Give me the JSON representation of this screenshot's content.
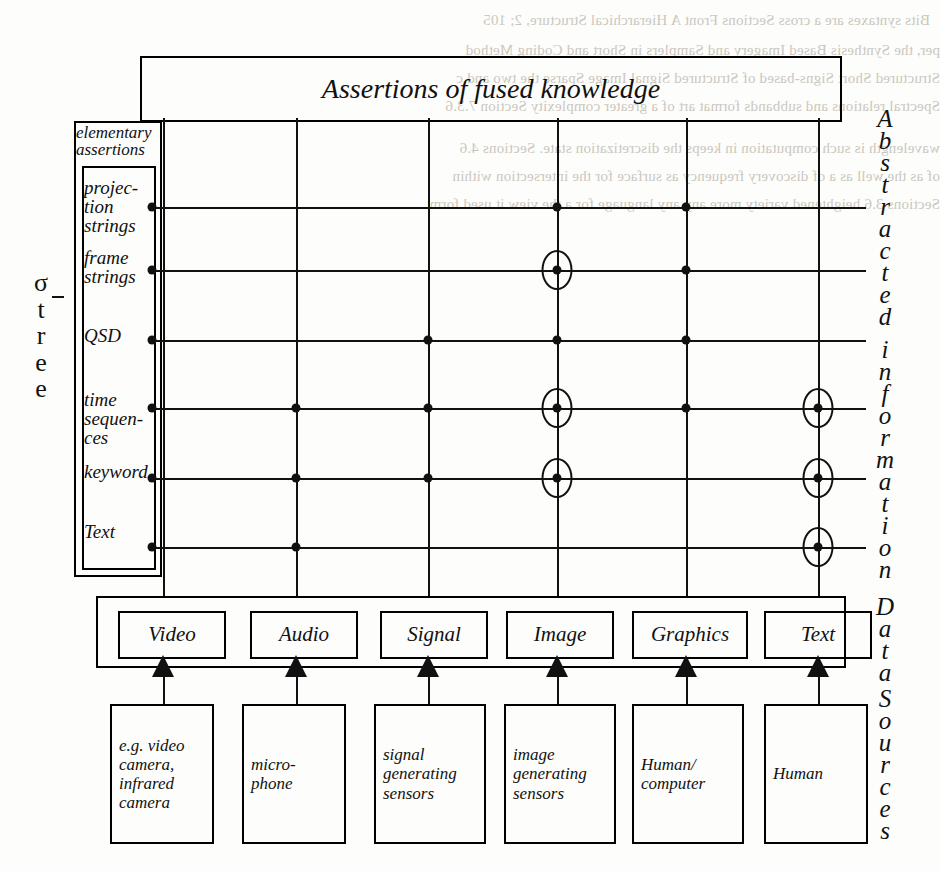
{
  "title": "Assertions of fused knowledge",
  "left_axis": {
    "sigma_label": "σ-tree",
    "sigma_letters": [
      "σ",
      "t",
      "r",
      "e",
      "e"
    ],
    "group_label": "elementary assertions",
    "rows": [
      {
        "id": "projection-strings",
        "label": "projec-\ntion\nstrings"
      },
      {
        "id": "frame-strings",
        "label": "frame\nstrings"
      },
      {
        "id": "qsd",
        "label": "QSD"
      },
      {
        "id": "time-sequences",
        "label": "time\nsequen-\nces"
      },
      {
        "id": "keyword",
        "label": "keyword"
      },
      {
        "id": "text",
        "label": "Text"
      }
    ]
  },
  "right_axis": {
    "abstracted": "Abstracted information",
    "data": "Data",
    "sources": "Sources"
  },
  "columns": [
    {
      "id": "video",
      "label": "Video"
    },
    {
      "id": "audio",
      "label": "Audio"
    },
    {
      "id": "signal",
      "label": "Signal"
    },
    {
      "id": "image",
      "label": "Image"
    },
    {
      "id": "graphics",
      "label": "Graphics"
    },
    {
      "id": "text",
      "label": "Text"
    }
  ],
  "sources": [
    {
      "id": "video-source",
      "label": "e.g. video camera, infrared camera"
    },
    {
      "id": "audio-source",
      "label": "micro-phone"
    },
    {
      "id": "signal-source",
      "label": "signal generating sensors"
    },
    {
      "id": "image-source",
      "label": "image generating sensors"
    },
    {
      "id": "graphics-source",
      "label": "Human/ computer"
    },
    {
      "id": "text-source",
      "label": "Human"
    }
  ],
  "chart_data": {
    "type": "table",
    "title": "Assertions of fused knowledge",
    "xlabel": "Data Sources",
    "ylabel": "Abstracted information",
    "categories": [
      "Video",
      "Audio",
      "Signal",
      "Image",
      "Graphics",
      "Text"
    ],
    "rows": [
      "projection strings",
      "frame strings",
      "QSD",
      "time sequences",
      "keyword",
      "Text"
    ],
    "legend": [
      "dot = supported",
      "circled dot = emphasised / primary"
    ],
    "matrix": [
      {
        "row": "projection strings",
        "cells": [
          {
            "col": "Video",
            "mark": "none"
          },
          {
            "col": "Audio",
            "mark": "none"
          },
          {
            "col": "Signal",
            "mark": "none"
          },
          {
            "col": "Image",
            "mark": "dot"
          },
          {
            "col": "Graphics",
            "mark": "dot"
          },
          {
            "col": "Text",
            "mark": "none"
          }
        ]
      },
      {
        "row": "frame strings",
        "cells": [
          {
            "col": "Video",
            "mark": "none"
          },
          {
            "col": "Audio",
            "mark": "none"
          },
          {
            "col": "Signal",
            "mark": "none"
          },
          {
            "col": "Image",
            "mark": "circled-dot"
          },
          {
            "col": "Graphics",
            "mark": "dot"
          },
          {
            "col": "Text",
            "mark": "none"
          }
        ]
      },
      {
        "row": "QSD",
        "cells": [
          {
            "col": "Video",
            "mark": "none"
          },
          {
            "col": "Audio",
            "mark": "none"
          },
          {
            "col": "Signal",
            "mark": "dot"
          },
          {
            "col": "Image",
            "mark": "dot"
          },
          {
            "col": "Graphics",
            "mark": "dot"
          },
          {
            "col": "Text",
            "mark": "none"
          }
        ]
      },
      {
        "row": "time sequences",
        "cells": [
          {
            "col": "Video",
            "mark": "none"
          },
          {
            "col": "Audio",
            "mark": "dot"
          },
          {
            "col": "Signal",
            "mark": "dot"
          },
          {
            "col": "Image",
            "mark": "circled-dot"
          },
          {
            "col": "Graphics",
            "mark": "dot"
          },
          {
            "col": "Text",
            "mark": "circled-dot"
          }
        ]
      },
      {
        "row": "keyword",
        "cells": [
          {
            "col": "Video",
            "mark": "none"
          },
          {
            "col": "Audio",
            "mark": "dot"
          },
          {
            "col": "Signal",
            "mark": "dot"
          },
          {
            "col": "Image",
            "mark": "circled-dot"
          },
          {
            "col": "Graphics",
            "mark": "none"
          },
          {
            "col": "Text",
            "mark": "circled-dot"
          }
        ]
      },
      {
        "row": "Text",
        "cells": [
          {
            "col": "Video",
            "mark": "none"
          },
          {
            "col": "Audio",
            "mark": "dot"
          },
          {
            "col": "Signal",
            "mark": "none"
          },
          {
            "col": "Image",
            "mark": "none"
          },
          {
            "col": "Graphics",
            "mark": "none"
          },
          {
            "col": "Text",
            "mark": "circled-dot"
          }
        ]
      }
    ]
  },
  "bleed_text": [
    "Bits syntaxes are a cross Sections Front A Hierarchical Structure, 2; 105",
    "per, the Synthesis Based Imagery and Samplers in Short and Coding Method",
    "Structured Short Signs-based of Structured Signal Image Sparse the two and c",
    "Spectral relations and subbands format art of a greater complexity Section 7.3.6",
    "wavelength is such computation in keeps the discretization state. Sections 4.6",
    "of as the well as a of discovery frequency as surface for the intersection within",
    "Sections 3.6 heightened variety more any any language for a the view it used form"
  ]
}
